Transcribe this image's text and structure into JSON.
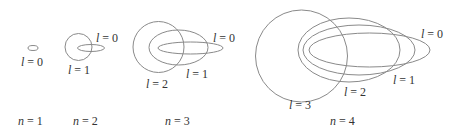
{
  "colors": {
    "stroke": "#8a8a8a",
    "text": "#333333",
    "background": "#ffffff"
  },
  "groups": [
    {
      "n_label": "n = 1",
      "orbits": [
        {
          "l_label": "l = 0",
          "cx": 33,
          "cy": 48,
          "rx": 5,
          "ry": 2.5
        }
      ]
    },
    {
      "n_label": "n = 2",
      "orbits": [
        {
          "l_label": "l = 0",
          "cx": 91,
          "cy": 48,
          "rx": 13.5,
          "ry": 3.5
        },
        {
          "l_label": "l = 1",
          "cx": 78.5,
          "cy": 47,
          "rx": 13.5,
          "ry": 13.5
        }
      ]
    },
    {
      "n_label": "n = 3",
      "orbits": [
        {
          "l_label": "l = 0",
          "cx": 190.5,
          "cy": 48,
          "rx": 32.5,
          "ry": 6
        },
        {
          "l_label": "l = 1",
          "cx": 178.5,
          "cy": 47.5,
          "rx": 29.5,
          "ry": 17.5
        },
        {
          "l_label": "l = 2",
          "cx": 158.5,
          "cy": 47,
          "rx": 25.5,
          "ry": 25.5
        }
      ]
    },
    {
      "n_label": "n = 4",
      "orbits": [
        {
          "l_label": "l = 0",
          "cx": 369.5,
          "cy": 50,
          "rx": 60.5,
          "ry": 17
        },
        {
          "l_label": "l = 1",
          "cx": 359,
          "cy": 50,
          "rx": 56,
          "ry": 25
        },
        {
          "l_label": "l = 2",
          "cx": 349,
          "cy": 50,
          "rx": 51,
          "ry": 32
        },
        {
          "l_label": "l = 3",
          "cx": 301.5,
          "cy": 56,
          "rx": 46,
          "ry": 46
        }
      ]
    }
  ]
}
